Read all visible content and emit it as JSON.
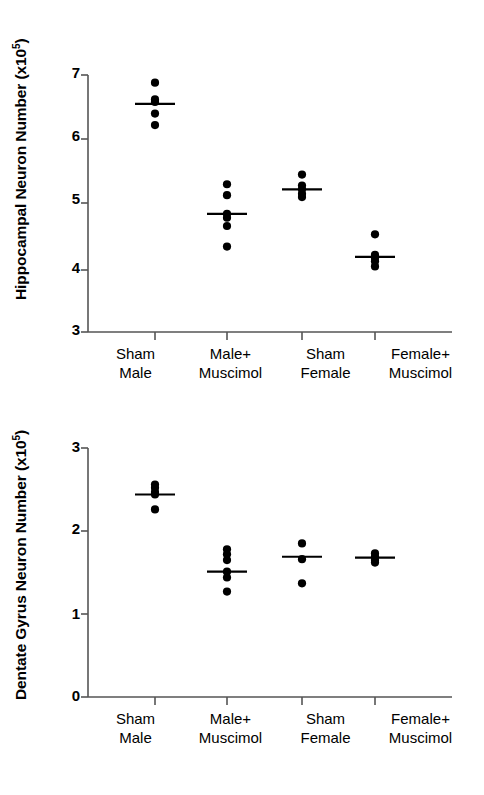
{
  "figure": {
    "background": "#ffffff",
    "marker_color": "#000000",
    "axis_color": "#555555",
    "panels": [
      "top",
      "bottom"
    ]
  },
  "chart_data": [
    {
      "id": "hippocampal",
      "type": "scatter",
      "title": "",
      "xlabel": "",
      "ylabel": "Hippocampal Neuron Number (x10⁵)",
      "ylabel_base": "Hippocampal Neuron Number (x10",
      "ylabel_exp": "5",
      "ylabel_close": ")",
      "ylim": [
        3,
        7
      ],
      "yticks": [
        3,
        4,
        5,
        6,
        7
      ],
      "ytick_labels": [
        "3",
        "4",
        "5",
        "6",
        "7"
      ],
      "grid": false,
      "legend": "none",
      "categories": [
        "Sham Male",
        "Male+ Muscimol",
        "Sham Female",
        "Female+ Muscimol"
      ],
      "category_lines": [
        [
          "Sham",
          "Male"
        ],
        [
          "Male+",
          "Muscimol"
        ],
        [
          "Sham",
          "Female"
        ],
        [
          "Female+",
          "Muscimol"
        ]
      ],
      "series": [
        {
          "name": "Sham Male",
          "values": [
            6.88,
            6.62,
            6.58,
            6.4,
            6.22
          ],
          "mean": 6.55
        },
        {
          "name": "Male+ Muscimol",
          "values": [
            5.3,
            5.13,
            4.84,
            4.78,
            4.65,
            4.33
          ],
          "mean": 4.84
        },
        {
          "name": "Sham Female",
          "values": [
            5.45,
            5.28,
            5.22,
            5.15,
            5.1
          ],
          "mean": 5.22
        },
        {
          "name": "Female+ Muscimol",
          "values": [
            4.52,
            4.2,
            4.15,
            4.1,
            4.02
          ],
          "mean": 4.17
        }
      ]
    },
    {
      "id": "dentate-gyrus",
      "type": "scatter",
      "title": "",
      "xlabel": "",
      "ylabel": "Dentate Gyrus Neuron Number (x10⁵)",
      "ylabel_base": "Dentate Gyrus Neuron Number (x10",
      "ylabel_exp": "5",
      "ylabel_close": ")",
      "ylim": [
        0,
        3
      ],
      "yticks": [
        0,
        1,
        2,
        3
      ],
      "ytick_labels": [
        "0",
        "1",
        "2",
        "3"
      ],
      "grid": false,
      "legend": "none",
      "categories": [
        "Sham Male",
        "Male+ Muscimol",
        "Sham Female",
        "Female+ Muscimol"
      ],
      "category_lines": [
        [
          "Sham",
          "Male"
        ],
        [
          "Male+",
          "Muscimol"
        ],
        [
          "Sham",
          "Female"
        ],
        [
          "Female+",
          "Muscimol"
        ]
      ],
      "series": [
        {
          "name": "Sham Male",
          "values": [
            2.56,
            2.52,
            2.47,
            2.44,
            2.26
          ],
          "mean": 2.44
        },
        {
          "name": "Male+ Muscimol",
          "values": [
            1.78,
            1.72,
            1.65,
            1.51,
            1.44,
            1.27
          ],
          "mean": 1.51
        },
        {
          "name": "Sham Female",
          "values": [
            1.85,
            1.66,
            1.37
          ],
          "mean": 1.69
        },
        {
          "name": "Female+ Muscimol",
          "values": [
            1.73,
            1.69,
            1.65,
            1.62
          ],
          "mean": 1.68
        }
      ]
    }
  ]
}
